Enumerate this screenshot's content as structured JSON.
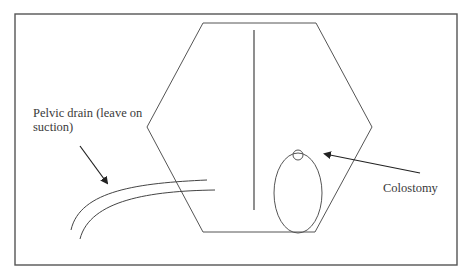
{
  "diagram": {
    "type": "surgical-abdomen-schematic",
    "stroke_color": "#555555",
    "labels": {
      "pelvic_drain": "Pelvic drain (leave on suction)",
      "colostomy": "Colostomy"
    },
    "elements": [
      "outer-frame",
      "abdomen-hexagon",
      "midline-incision",
      "colostomy-stoma-oval",
      "stoma-opening",
      "pelvic-drain-tube",
      "drain-pointer-arrow",
      "colostomy-pointer-arrow"
    ]
  }
}
